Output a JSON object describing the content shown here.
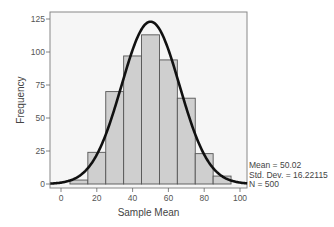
{
  "chart_data": {
    "type": "bar",
    "subtype": "histogram_with_normal_curve",
    "title": "",
    "xlabel": "Sample Mean",
    "ylabel": "Frequency",
    "x_ticks": [
      0,
      20,
      40,
      60,
      80,
      100
    ],
    "y_ticks": [
      0,
      25,
      50,
      75,
      100,
      125
    ],
    "xlim": [
      -6,
      104
    ],
    "ylim": [
      0,
      130
    ],
    "grid": false,
    "bins": [
      {
        "from": 5,
        "to": 15,
        "count": 3
      },
      {
        "from": 15,
        "to": 25,
        "count": 24
      },
      {
        "from": 25,
        "to": 35,
        "count": 70
      },
      {
        "from": 35,
        "to": 45,
        "count": 97
      },
      {
        "from": 45,
        "to": 55,
        "count": 113
      },
      {
        "from": 55,
        "to": 65,
        "count": 94
      },
      {
        "from": 65,
        "to": 75,
        "count": 65
      },
      {
        "from": 75,
        "to": 85,
        "count": 23
      },
      {
        "from": 85,
        "to": 95,
        "count": 6
      }
    ],
    "categories": [
      "5-15",
      "15-25",
      "25-35",
      "35-45",
      "45-55",
      "55-65",
      "65-75",
      "75-85",
      "85-95"
    ],
    "values": [
      3,
      24,
      70,
      97,
      113,
      94,
      65,
      23,
      6
    ],
    "normal_curve": {
      "mean": 50.02,
      "sd": 16.22115,
      "n": 500,
      "bin_width": 10,
      "peak": 122
    },
    "legend": {
      "mean_label": "Mean = 50.02",
      "sd_label": "Std. Dev. = 16.22115",
      "n_label": "N = 500",
      "position": "right-bottom"
    },
    "colors": {
      "bar_fill": "#cfcfcf",
      "bar_stroke": "#555555",
      "curve": "#111111",
      "plot_bg": "#f6f6f6",
      "axis": "#666666"
    }
  }
}
